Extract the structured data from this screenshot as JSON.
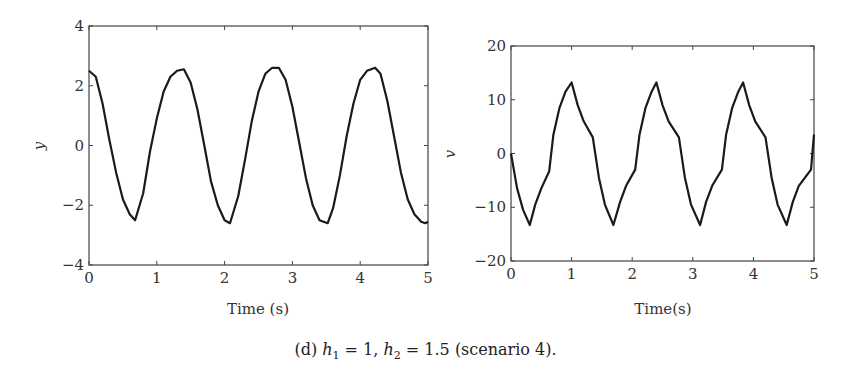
{
  "caption": {
    "prefix": "(d) ",
    "h1_var": "h",
    "h1_sub": "1",
    "h1_rest": " = 1, ",
    "h2_var": "h",
    "h2_sub": "2",
    "h2_rest": " = 1.5 (scenario 4)."
  },
  "chart_data": [
    {
      "type": "line",
      "title": "",
      "xlabel": "Time (s)",
      "ylabel": "y",
      "xlim": [
        0,
        5
      ],
      "ylim": [
        -4,
        4
      ],
      "xticks": [
        "0",
        "1",
        "2",
        "3",
        "4",
        "5"
      ],
      "yticks": [
        "-4",
        "-2",
        "0",
        "2",
        "4"
      ],
      "grid": false,
      "legend": null,
      "series": [
        {
          "name": "y",
          "color": "#1a1a1a",
          "x": [
            0,
            0.1,
            0.2,
            0.3,
            0.4,
            0.5,
            0.6,
            0.68,
            0.8,
            0.9,
            1.0,
            1.1,
            1.2,
            1.3,
            1.4,
            1.5,
            1.6,
            1.7,
            1.8,
            1.9,
            2.0,
            2.08,
            2.2,
            2.3,
            2.4,
            2.5,
            2.6,
            2.7,
            2.8,
            2.9,
            3.0,
            3.1,
            3.2,
            3.3,
            3.4,
            3.52,
            3.6,
            3.7,
            3.8,
            3.9,
            4.0,
            4.1,
            4.22,
            4.3,
            4.4,
            4.5,
            4.6,
            4.7,
            4.8,
            4.9,
            4.96,
            5.0
          ],
          "values": [
            2.5,
            2.3,
            1.4,
            0.2,
            -0.9,
            -1.8,
            -2.3,
            -2.5,
            -1.6,
            -0.2,
            0.9,
            1.8,
            2.3,
            2.5,
            2.55,
            2.1,
            1.2,
            0.0,
            -1.2,
            -2.0,
            -2.5,
            -2.6,
            -1.7,
            -0.5,
            0.8,
            1.8,
            2.4,
            2.6,
            2.6,
            2.2,
            1.3,
            0.1,
            -1.1,
            -2.0,
            -2.5,
            -2.6,
            -2.1,
            -1.0,
            0.3,
            1.4,
            2.2,
            2.5,
            2.6,
            2.4,
            1.5,
            0.3,
            -0.9,
            -1.8,
            -2.3,
            -2.55,
            -2.6,
            -2.55
          ]
        }
      ]
    },
    {
      "type": "line",
      "title": "",
      "xlabel": "Time(s)",
      "ylabel": "v",
      "xlim": [
        0,
        5
      ],
      "ylim": [
        -20,
        20
      ],
      "xticks": [
        "0",
        "1",
        "2",
        "3",
        "4",
        "5"
      ],
      "yticks": [
        "-20",
        "-10",
        "0",
        "10",
        "20"
      ],
      "grid": false,
      "legend": null,
      "series": [
        {
          "name": "v",
          "color": "#1a1a1a",
          "x": [
            0,
            0.1,
            0.2,
            0.31,
            0.4,
            0.5,
            0.63,
            0.7,
            0.8,
            0.9,
            1.0,
            1.1,
            1.2,
            1.35,
            1.45,
            1.55,
            1.69,
            1.8,
            1.9,
            2.05,
            2.12,
            2.22,
            2.32,
            2.4,
            2.5,
            2.6,
            2.77,
            2.87,
            2.97,
            3.12,
            3.22,
            3.32,
            3.48,
            3.55,
            3.65,
            3.75,
            3.83,
            3.93,
            4.03,
            4.2,
            4.3,
            4.4,
            4.55,
            4.65,
            4.75,
            4.95,
            5.0
          ],
          "values": [
            0,
            -6.5,
            -10.5,
            -13.3,
            -9.5,
            -6.5,
            -3.3,
            3.5,
            8.5,
            11.5,
            13.2,
            9.0,
            6.0,
            3.0,
            -4.5,
            -9.5,
            -13.3,
            -9.0,
            -6.0,
            -3.0,
            3.5,
            8.5,
            11.5,
            13.2,
            9.0,
            6.0,
            3.0,
            -4.5,
            -9.5,
            -13.3,
            -9.0,
            -6.0,
            -3.0,
            3.5,
            8.5,
            11.5,
            13.2,
            9.0,
            6.0,
            3.0,
            -4.5,
            -9.5,
            -13.3,
            -9.0,
            -6.0,
            -3.0,
            3.5
          ]
        }
      ]
    }
  ]
}
